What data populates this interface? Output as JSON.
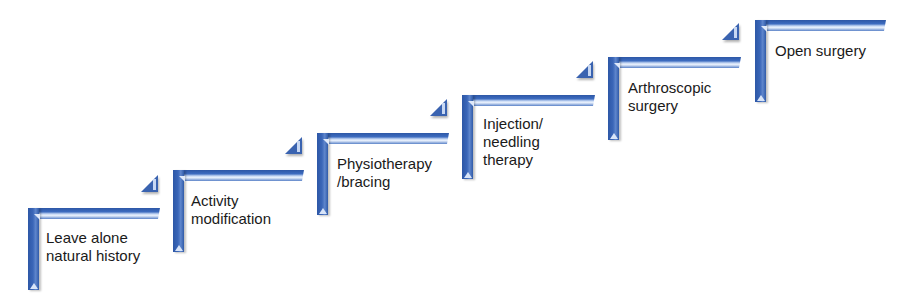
{
  "diagram": {
    "type": "staircase",
    "colors": {
      "step_blue": "#3a63b0",
      "highlight": "#e8f0fc",
      "text": "#1a1a1a"
    },
    "steps": [
      {
        "label_line1": "Leave alone",
        "label_line2": "natural history"
      },
      {
        "label_line1": "Activity",
        "label_line2": "modification"
      },
      {
        "label_line1": "Physiotherapy",
        "label_line2": "/bracing"
      },
      {
        "label_line1": "Injection/",
        "label_line2": "needling",
        "label_line3": "therapy"
      },
      {
        "label_line1": "Arthroscopic",
        "label_line2": "surgery"
      },
      {
        "label_line1": "Open surgery"
      }
    ]
  }
}
